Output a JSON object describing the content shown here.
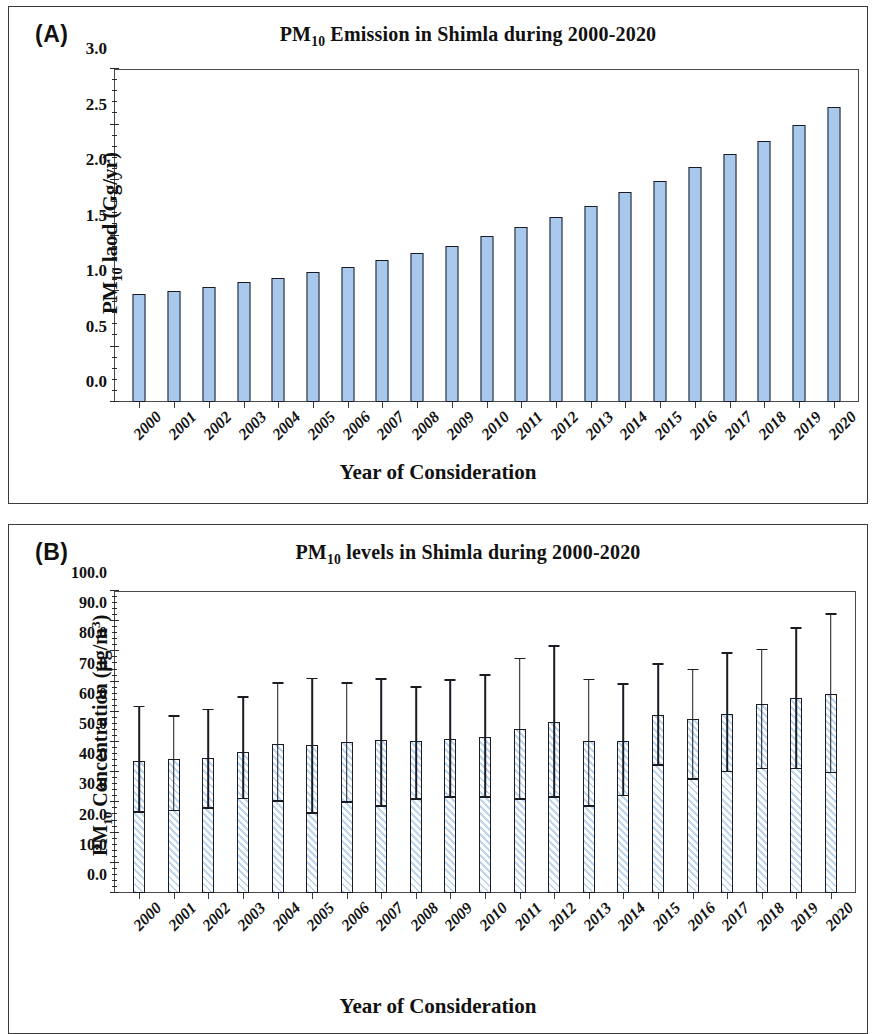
{
  "figure": {
    "panels": [
      {
        "letter": "(A)",
        "title_html": "PM<sub>10</sub> Emission in Shimla during 2000-2020"
      },
      {
        "letter": "(B)",
        "title_html": "PM<sub>10</sub> levels in Shimla during 2000-2020"
      }
    ],
    "xlabel": "Year of Consideration"
  },
  "chart_data": [
    {
      "type": "bar",
      "panel": "(A)",
      "title": "PM10 Emission in Shimla during 2000-2020",
      "xlabel": "Year of Consideration",
      "ylabel": "PM10 laod (Gg/yr)",
      "ylabel_html": "PM<sub>10</sub> laod (Gg/yr)",
      "ylim": [
        0.0,
        3.0
      ],
      "ytick_step": 0.5,
      "yticks": [
        0.0,
        0.5,
        1.0,
        1.5,
        2.0,
        2.5,
        3.0
      ],
      "ytick_labels": [
        "0.0",
        "0.5",
        "1.0",
        "1.5",
        "2.0",
        "2.5",
        "3.0"
      ],
      "grid": false,
      "legend": "none",
      "bar_color": "#a8c8ec",
      "bar_edge_color": "#1b1b24",
      "categories": [
        "2000",
        "2001",
        "2002",
        "2003",
        "2004",
        "2005",
        "2006",
        "2007",
        "2008",
        "2009",
        "2010",
        "2011",
        "2012",
        "2013",
        "2014",
        "2015",
        "2016",
        "2017",
        "2018",
        "2019",
        "2020"
      ],
      "values": [
        0.97,
        1.0,
        1.04,
        1.08,
        1.12,
        1.17,
        1.22,
        1.28,
        1.34,
        1.41,
        1.5,
        1.58,
        1.67,
        1.77,
        1.89,
        1.99,
        2.12,
        2.23,
        2.35,
        2.5,
        2.66
      ]
    },
    {
      "type": "bar",
      "panel": "(B)",
      "title": "PM10 levels in Shimla during 2000-2020",
      "xlabel": "Year of Consideration",
      "ylabel": "PM10 Concentration (ug/m3)",
      "ylabel_html": "PM<sub>10</sub> Concentration (&micro;g/m<sup>3</sup>)",
      "ylim": [
        0.0,
        100.0
      ],
      "ytick_step": 10.0,
      "yticks": [
        0.0,
        10.0,
        20.0,
        30.0,
        40.0,
        50.0,
        60.0,
        70.0,
        80.0,
        90.0,
        100.0
      ],
      "ytick_labels": [
        "0.0",
        "10.0",
        "20.0",
        "30.0",
        "40.0",
        "50.0",
        "60.0",
        "70.0",
        "80.0",
        "90.0",
        "100.0"
      ],
      "grid": false,
      "legend": "none",
      "bar_fill": "diagonal-hatch light blue on white",
      "bar_edge_color": "#1b1b24",
      "categories": [
        "2000",
        "2001",
        "2002",
        "2003",
        "2004",
        "2005",
        "2006",
        "2007",
        "2008",
        "2009",
        "2010",
        "2011",
        "2012",
        "2013",
        "2014",
        "2015",
        "2016",
        "2017",
        "2018",
        "2019",
        "2020"
      ],
      "values": [
        43.8,
        44.5,
        44.6,
        46.8,
        49.4,
        48.9,
        49.9,
        50.6,
        50.3,
        51.0,
        51.7,
        54.2,
        56.6,
        50.2,
        50.5,
        58.8,
        57.5,
        59.2,
        62.5,
        64.5,
        66.0
      ],
      "error_upper": [
        61.5,
        58.4,
        60.5,
        64.6,
        69.2,
        70.8,
        69.2,
        70.5,
        68.0,
        70.3,
        71.9,
        77.4,
        81.5,
        70.4,
        68.9,
        75.5,
        73.7,
        79.2,
        80.4,
        87.5,
        92.0
      ],
      "error_lower": [
        26.5,
        27.0,
        27.8,
        31.0,
        30.2,
        26.3,
        29.8,
        28.5,
        30.8,
        31.5,
        31.5,
        30.9,
        31.5,
        28.6,
        32.0,
        42.0,
        37.4,
        40.0,
        41.0,
        41.0,
        39.6
      ]
    }
  ]
}
